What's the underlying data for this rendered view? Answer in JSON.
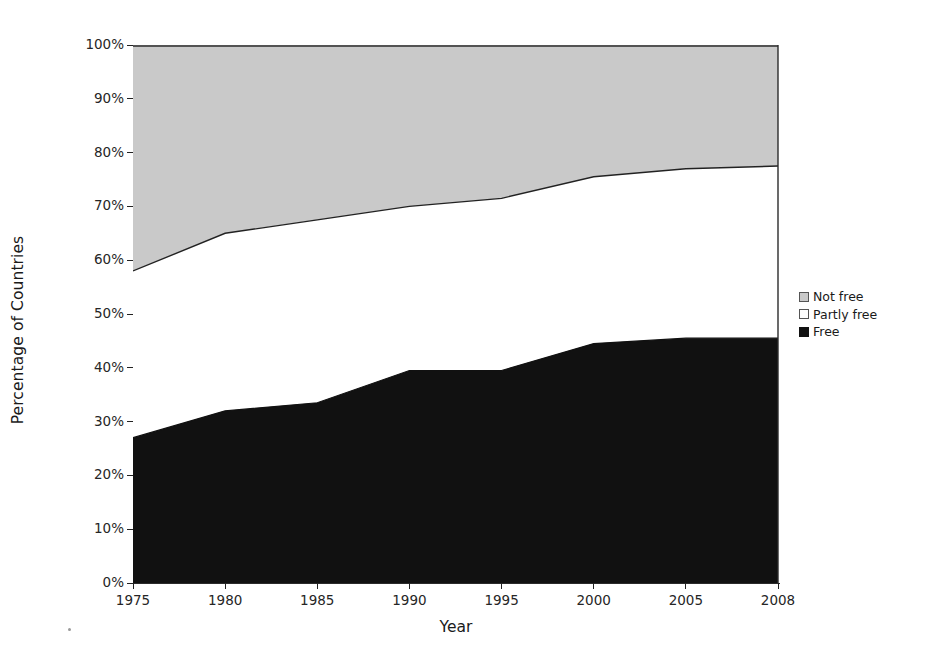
{
  "chart_data": {
    "type": "area",
    "title": "",
    "subtitle": "",
    "xlabel": "Year",
    "ylabel": "Percentage of Countries",
    "x": [
      1975,
      1980,
      1985,
      1990,
      1995,
      2000,
      2005,
      2008
    ],
    "categories": [
      "1975",
      "1980",
      "1985",
      "1990",
      "1995",
      "2000",
      "2005",
      "2008"
    ],
    "stacked": true,
    "ylim": [
      0,
      100
    ],
    "xlim": [
      1975,
      2008
    ],
    "grid": false,
    "legend_position": "right",
    "y_tick_labels": [
      "100%",
      "90%",
      "80%",
      "70%",
      "60%",
      "50%",
      "40%",
      "30%",
      "20%",
      "10%",
      "0%"
    ],
    "y_tick_values": [
      100,
      90,
      80,
      70,
      60,
      50,
      40,
      30,
      20,
      10,
      0
    ],
    "series": [
      {
        "name": "Free",
        "color": "#111111",
        "values": [
          27,
          32,
          33.5,
          39.5,
          39.5,
          44.5,
          45.5,
          45.5
        ]
      },
      {
        "name": "Partly free",
        "color": "#ffffff",
        "values": [
          31,
          33,
          34,
          30.5,
          32,
          31,
          31.5,
          32
        ],
        "cumulative_top": [
          58,
          65,
          67.5,
          70,
          71.5,
          75.5,
          77,
          77.5
        ]
      },
      {
        "name": "Not free",
        "color": "#c9c9c9",
        "values": [
          42,
          35,
          32.5,
          30,
          28.5,
          24.5,
          23,
          22.5
        ],
        "cumulative_top": [
          100,
          100,
          100,
          100,
          100,
          100,
          100,
          100
        ]
      }
    ]
  },
  "legend": {
    "items": [
      {
        "label": "Not free",
        "swatch": "notfree-swatch"
      },
      {
        "label": "Partly free",
        "swatch": "partlyfree-swatch"
      },
      {
        "label": "Free",
        "swatch": "free-swatch"
      }
    ]
  },
  "axes": {
    "x_title": "Year",
    "y_title": "Percentage of Countries"
  }
}
